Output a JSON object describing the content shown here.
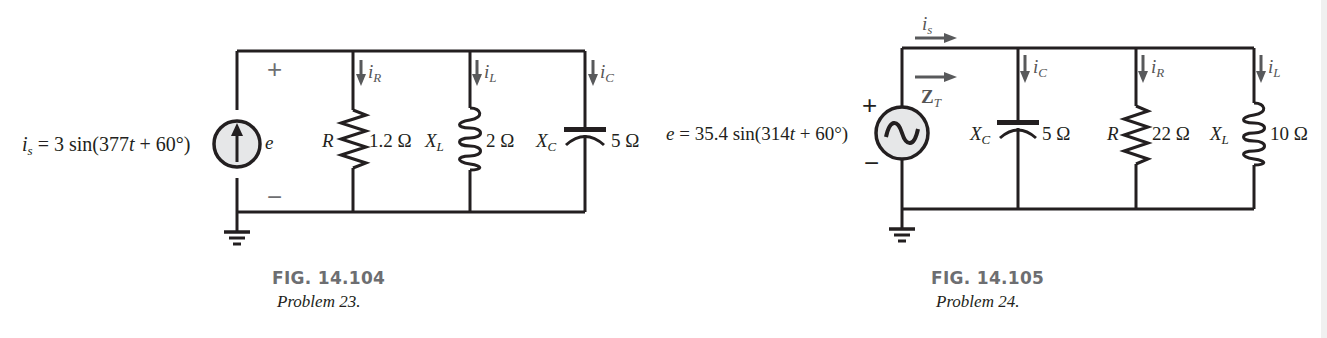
{
  "figures": [
    {
      "id": "fig-14-104",
      "caption": {
        "number": "FIG. 14.104",
        "subtitle": "Problem 23."
      },
      "source": {
        "type": "current-source",
        "symbol": "i",
        "subscript": "s",
        "expression": " = 3 sin(377",
        "tvar": "t",
        "expression_tail": " + 60°)",
        "voltage_label": "e",
        "plus": "+",
        "minus": "−"
      },
      "branches": [
        {
          "element": "resistor",
          "name_sym": "R",
          "name_sub": "",
          "value": "1.2 Ω",
          "current_sym": "i",
          "current_sub": "R"
        },
        {
          "element": "inductor",
          "name_sym": "X",
          "name_sub": "L",
          "value": "2 Ω",
          "current_sym": "i",
          "current_sub": "L"
        },
        {
          "element": "capacitor",
          "name_sym": "X",
          "name_sub": "C",
          "value": "5 Ω",
          "current_sym": "i",
          "current_sub": "C"
        }
      ]
    },
    {
      "id": "fig-14-105",
      "caption": {
        "number": "FIG. 14.105",
        "subtitle": "Problem 24."
      },
      "source": {
        "type": "ac-voltage-source",
        "symbol": "e",
        "expression": " = 35.4 sin(314",
        "tvar": "t",
        "expression_tail": " + 60°)",
        "plus": "+",
        "minus": "−",
        "source_current_sym": "i",
        "source_current_sub": "s",
        "impedance_sym": "Z",
        "impedance_sub": "T"
      },
      "branches": [
        {
          "element": "capacitor",
          "name_sym": "X",
          "name_sub": "C",
          "value": "5 Ω",
          "current_sym": "i",
          "current_sub": "C"
        },
        {
          "element": "resistor",
          "name_sym": "R",
          "name_sub": "",
          "value": "22 Ω",
          "current_sym": "i",
          "current_sub": "R"
        },
        {
          "element": "inductor",
          "name_sym": "X",
          "name_sub": "L",
          "value": "10 Ω",
          "current_sym": "i",
          "current_sub": "L"
        }
      ]
    }
  ],
  "colors": {
    "wire": "#231f20",
    "arrow": "#58595b",
    "source_fill": "#e6e7e8",
    "caption_gray": "#6d6e71"
  }
}
